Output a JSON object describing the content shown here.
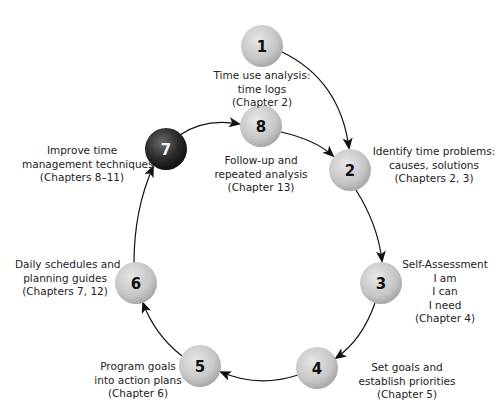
{
  "diagram": {
    "type": "cycle",
    "nodes": [
      {
        "id": 1,
        "number": "1",
        "lines": [
          "Time use analysis:",
          "time logs",
          "(Chapter 2)"
        ],
        "highlight": false
      },
      {
        "id": 2,
        "number": "2",
        "lines": [
          "Identify time problems:",
          "causes, solutions",
          "(Chapters 2, 3)"
        ],
        "highlight": false
      },
      {
        "id": 3,
        "number": "3",
        "lines": [
          "Self-Assessment",
          "I am",
          "I can",
          "I need",
          "(Chapter 4)"
        ],
        "highlight": false
      },
      {
        "id": 4,
        "number": "4",
        "lines": [
          "Set goals and",
          "establish priorities",
          "(Chapter 5)"
        ],
        "highlight": false
      },
      {
        "id": 5,
        "number": "5",
        "lines": [
          "Program goals",
          "into action plans",
          "(Chapter 6)"
        ],
        "highlight": false
      },
      {
        "id": 6,
        "number": "6",
        "lines": [
          "Daily schedules and",
          "planning guides",
          "(Chapters 7, 12)"
        ],
        "highlight": false
      },
      {
        "id": 7,
        "number": "7",
        "lines": [
          "Improve time",
          "management techniques",
          "(Chapters 8–11)"
        ],
        "highlight": true
      },
      {
        "id": 8,
        "number": "8",
        "lines": [
          "Follow-up and",
          "repeated analysis",
          "(Chapter 13)"
        ],
        "highlight": false
      }
    ],
    "edges": [
      {
        "from": 1,
        "to": 2
      },
      {
        "from": 8,
        "to": 2
      },
      {
        "from": 2,
        "to": 3
      },
      {
        "from": 3,
        "to": 4
      },
      {
        "from": 4,
        "to": 5
      },
      {
        "from": 5,
        "to": 6
      },
      {
        "from": 6,
        "to": 7
      },
      {
        "from": 7,
        "to": 8
      }
    ],
    "colors": {
      "node_fill": "#c8c8c8",
      "node_highlight_fill": "#2a2a2a",
      "arrow": "#111111",
      "text": "#222222"
    }
  }
}
